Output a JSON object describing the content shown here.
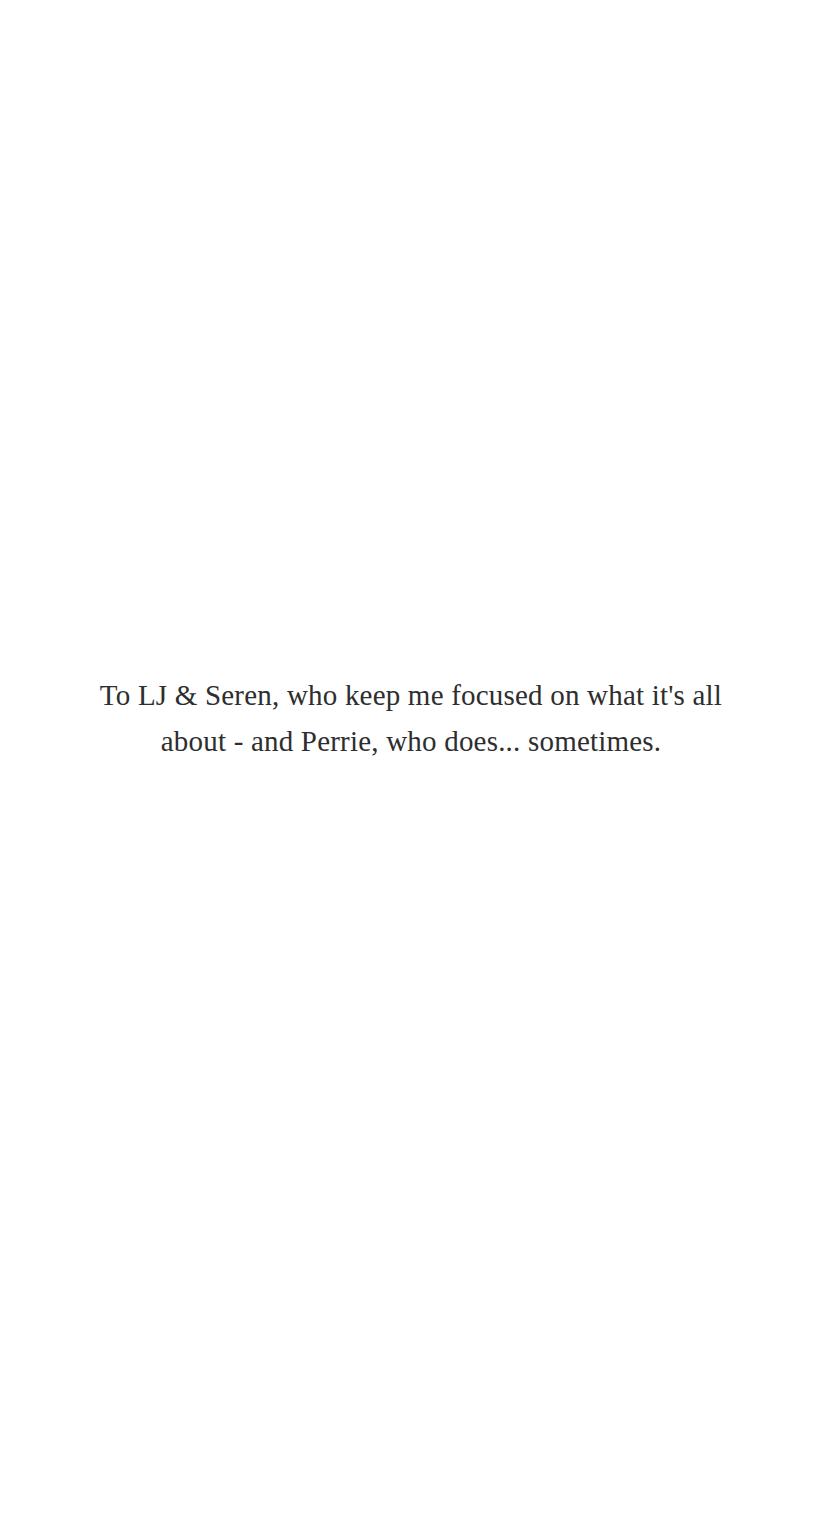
{
  "page": {
    "background_color": "#ffffff",
    "text_color": "#2e2e2e"
  },
  "dedication": {
    "lines": [
      "To LJ & Seren, who keep me focused on what it's all",
      "about - and Perrie, who does... sometimes."
    ],
    "full_text": "To LJ & Seren, who keep me focused on what it's all about - and Perrie, who does... sometimes."
  }
}
